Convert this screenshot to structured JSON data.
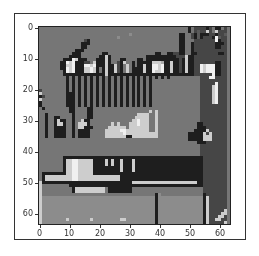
{
  "chart_data": {
    "type": "heatmap",
    "title": "",
    "xlabel": "",
    "ylabel": "",
    "colormap": "gray",
    "shape": [
      64,
      64
    ],
    "xlim": [
      -0.5,
      63.5
    ],
    "ylim": [
      63.5,
      -0.5
    ],
    "x_ticks": [
      "0",
      "10",
      "20",
      "30",
      "40",
      "50",
      "60"
    ],
    "y_ticks": [
      "0",
      "10",
      "20",
      "30",
      "40",
      "50",
      "60"
    ],
    "grid": false,
    "legend": null,
    "rows": [
      "5555555555555555555555555555555555555555555555555515222212511525",
      "5555555555555555555555555555555555555555555555555515232282582225",
      "5555555555555555555555555555556555555555555555511552131112212235",
      "5555555555555555555555555565555555555555555555511552131222193225",
      "5555555555555552155555555555555555555555555555511555222222291225",
      "5555555555555511155555555555555555555555555555511551222222211125",
      "5555555555555511555555555555555555555555555555511551222222211225",
      "5555555555551115555555555555555555555555555555511551222222222225",
      "5555555555511155555551155555555555555551155112211551122222221125",
      "5555555555111155555511815555555555551111111111222811222222222225",
      "5555555511198111555111815551155551151111111111121811222222222225",
      "5555555119891112258111815521855151111188871181121811222222211225",
      "5555555118891119989111811821585151181199891181121811229899911225",
      "5555555119891118898151811821585111181199891181121811229899911225",
      "5555555519891118898151811821585111181198891181121811229899911225",
      "5555555511111111111111811111111111111111111111111111222222911225",
      "5555555551515151515151515151515151515151515155555555552229922225",
      "5555555551515151515151515151515151515155555555555555552222222225",
      "5555555551515151515151515151515151515155555555555555552222292225",
      "5555555551515151515151515151515151515155555555555555552222892225",
      "2555555551515151515151515151515151515155555555555555552222892225",
      "8555555551115151515151515151515151515155555555555555552222892225",
      "1255555551115151515151515151515151515155555555555555552222892225",
      "8555555551115151515151515151515151515155555555555555552222892225",
      "1555555551115151515151515151515151515155555555555555552222892225",
      "1555555551115151515151515151515151515155555555555555552222222225",
      "5155555555115555115555555555555555555555555555555555552222222225",
      "5555555555115555115555555555555555555858555555555555552222222225",
      "5515555555515555115555555555555558888558555555555555552222222225",
      "5515511555515555115555555555555588888558555555555555552222222225",
      "5515518115515581155555555555555889888558555555555555552222222225",
      "5515518815515888155555558585558889888558555555555555511222222225",
      "5515511115515881115555588888858888888558555555555555511122222225",
      "5515511115515111155555888889988888888558555555555555111182222225",
      "5515511115515111155555888888988888888888555555555511111828222225",
      "5515511115515111155555888888811888888888555555555511111888222225",
      "5555555555555555555555555555555555555555555555555511111888222225",
      "5555555555555555555555555555555555555555555555555555511122222225",
      "5555555555555555555555555555555555555555555555555555552222222225",
      "5555555555555555555555555555555555555555555555555555552222222225",
      "5555555555555555555555555555555555555555555555555555552222222225",
      "5555555555555555555555555555555555555555555555555555552222222225",
      "5555555511111111111111111111111111111111111111111111111222222225",
      "5555555518899888881111818118111811111111111111111111111222222225",
      "5555555518899888881111818118111811111111111111111111111222222225",
      "5555555518899888881111111118111811111111111111111111111222222225",
      "5555555518899888881111111118111811111111111111111111111222222225",
      "5111111118899888881111111111111111111111111111111111111222222225",
      "5188888888899888888888888881111111111111111111111111111222222225",
      "5188888888899888888888888881111111111111111111111111111222222225",
      "8111111111111111111111111111111888888888888888888888811222222225",
      "8555555555111111111111111111111111111111111111111111111222222225",
      "8555555555518888888888511111111555555555555555555555555222222225",
      "8555555555518888888888511111111555555555555555555555555222222225",
      "8555555555555555555555555555555555555551655555555555555122222225",
      "8666666666666666666666666666666666666661666666666666666182222225",
      "8666666666666666666666666666666666666661666666666666666182222225",
      "8666666666666666666666666666666666666661666666666666666182222225",
      "8666666666666666666666666666666666666661666666666666666182222225",
      "8666666666666666666666666666666666666661666666666666666182222285",
      "8666666666666666666666666666666666666661666666666666666182222885",
      "8666666666666666666666666666666666666661666666666666666182228825",
      "8666666668666666686666666668866666666661666666666666666182288225",
      "8666666666666666666666666666666666666661666666666666666182222285"
    ]
  }
}
